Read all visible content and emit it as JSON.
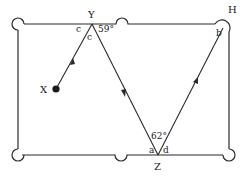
{
  "diagram": {
    "type": "billiard-table-reflection",
    "points": {
      "X": {
        "label": "X"
      },
      "Y": {
        "label": "Y"
      },
      "Z": {
        "label": "Z"
      },
      "H": {
        "label": "H"
      }
    },
    "angles": {
      "a": "a",
      "b": "b",
      "c_left": "c",
      "c_right": "c",
      "d": "d",
      "y_angle": "59°",
      "z_angle": "62°"
    },
    "path": [
      "X",
      "Y",
      "Z",
      "H"
    ],
    "colors": {
      "line": "#2a2a2a",
      "ball": "#1a1a1a",
      "background": "#ffffff"
    }
  }
}
